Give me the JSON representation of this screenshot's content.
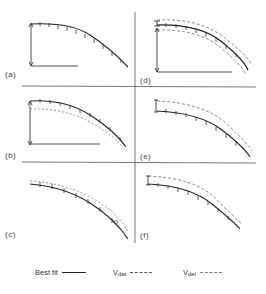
{
  "figure": {
    "panels": [
      {
        "id": "a",
        "label": "(a)"
      },
      {
        "id": "b",
        "label": "(b)"
      },
      {
        "id": "c",
        "label": "(c)"
      },
      {
        "id": "d",
        "label": "(d)"
      },
      {
        "id": "e",
        "label": "(e)"
      },
      {
        "id": "f",
        "label": "(f)"
      }
    ],
    "legend": {
      "best_fit": {
        "label": "Best fit",
        "style": "solid"
      },
      "v_dat": {
        "label": "V",
        "sub": "dat",
        "style": "dashed"
      },
      "v_del": {
        "label": "V",
        "sub": "del",
        "style": "dashed"
      }
    },
    "colors": {
      "line": "#222222",
      "dashed": "#555555",
      "divider": "#444444"
    }
  }
}
